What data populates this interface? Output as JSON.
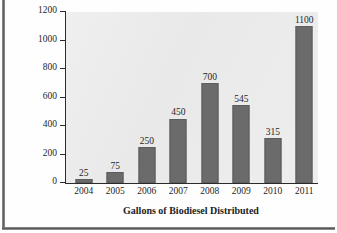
{
  "chart_data": {
    "type": "bar",
    "title": "",
    "xlabel": "Gallons of Biodiesel Distributed",
    "ylabel": "Million gallons",
    "categories": [
      "2004",
      "2005",
      "2006",
      "2007",
      "2008",
      "2009",
      "2010",
      "2011"
    ],
    "values": [
      25,
      75,
      250,
      450,
      700,
      545,
      315,
      1100
    ],
    "value_labels": [
      "25",
      "75",
      "250",
      "450",
      "700",
      "545",
      "315",
      "1100"
    ],
    "ylim": [
      0,
      1200
    ],
    "yticks": [
      0,
      200,
      400,
      600,
      800,
      1000,
      1200
    ],
    "ytick_labels": [
      "0",
      "200",
      "400",
      "600",
      "800",
      "1000",
      "1200"
    ],
    "grid": false,
    "legend": null,
    "series": [
      {
        "name": "Million gallons",
        "values": [
          25,
          75,
          250,
          450,
          700,
          545,
          315,
          1100
        ]
      }
    ],
    "colors": {
      "bar_fill": "#6b6b6b",
      "bar_stroke": "#5d5d5d",
      "axis": "#2b2b2b",
      "plot_background": "#ececec",
      "text": "#1f1f1f",
      "page_background": "#fefefe",
      "page_edge": "#4a4a4a"
    }
  }
}
